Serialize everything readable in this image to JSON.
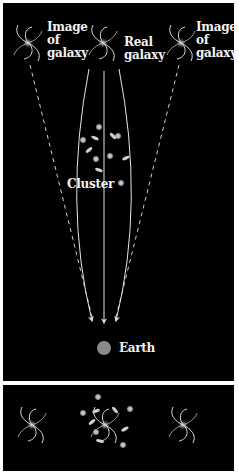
{
  "diagram": {
    "labels": {
      "image_left": "Image of galaxy",
      "image_left_lines": [
        "Image",
        "of",
        "galaxy"
      ],
      "real_galaxy_lines": [
        "Real",
        "galaxy"
      ],
      "image_right_lines": [
        "Image",
        "of",
        "galaxy"
      ],
      "cluster": "Cluster",
      "earth": "Earth"
    },
    "colors": {
      "background": "#000000",
      "frame": "#ffffff",
      "ray": "#e6e6e6",
      "earth": "#8a8a8a",
      "galaxy": "#d9d9d9",
      "cluster_member": "#bfbfbf"
    },
    "panels": [
      {
        "name": "top",
        "description": "side view: light paths from real galaxy bent by cluster toward Earth; dashed lines show apparent image directions"
      },
      {
        "name": "bottom",
        "description": "view from Earth: cluster in front of real galaxy with two lensed images on either side"
      }
    ]
  }
}
